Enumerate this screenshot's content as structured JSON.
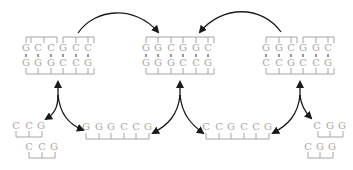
{
  "diagram": {
    "colors": {
      "bases": "#a6a6a6",
      "arrows": "#1a1a1a",
      "background": "#ffffff"
    },
    "duplexes": [
      {
        "id": "left",
        "top": [
          "G",
          "C",
          "C",
          "G",
          "C",
          "C"
        ],
        "bottom": [
          "G",
          "G",
          "G",
          "C",
          "C",
          "G"
        ],
        "top_backbone_split": true
      },
      {
        "id": "middle",
        "top": [
          "G",
          "G",
          "C",
          "G",
          "G",
          "C"
        ],
        "bottom": [
          "G",
          "G",
          "G",
          "C",
          "C",
          "G"
        ],
        "top_backbone_split": false
      },
      {
        "id": "right",
        "top": [
          "G",
          "G",
          "C",
          "G",
          "G",
          "C"
        ],
        "bottom": [
          "C",
          "C",
          "G",
          "C",
          "C",
          "G"
        ],
        "top_backbone_split": true
      }
    ],
    "single_strands": [
      {
        "id": "bottom-left-a",
        "bases": [
          "C",
          "C",
          "G"
        ]
      },
      {
        "id": "bottom-left-b",
        "bases": [
          "C",
          "C",
          "G"
        ]
      },
      {
        "id": "bottom-mid-left",
        "bases": [
          "G",
          "G",
          "G",
          "C",
          "C",
          "G"
        ]
      },
      {
        "id": "bottom-mid-right",
        "bases": [
          "C",
          "C",
          "G",
          "C",
          "C",
          "G"
        ]
      },
      {
        "id": "bottom-right-a",
        "bases": [
          "C",
          "G",
          "G"
        ]
      },
      {
        "id": "bottom-right-b",
        "bases": [
          "C",
          "G",
          "G"
        ]
      }
    ]
  }
}
